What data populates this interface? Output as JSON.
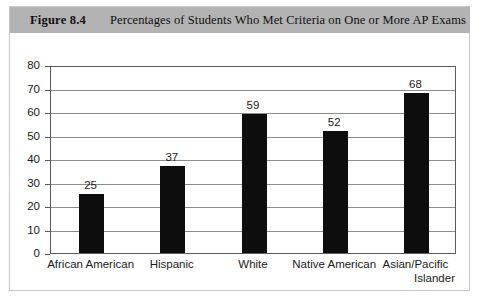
{
  "figure": {
    "number_label": "Figure 8.4",
    "caption": "Percentages of Students Who Met Criteria on One or More AP Exams",
    "band_color": "#b3b3b3"
  },
  "chart_data": {
    "type": "bar",
    "title": "Percentages of Students Who Met Criteria on One or More AP Exams",
    "xlabel": "",
    "ylabel": "",
    "ylim": [
      0,
      80
    ],
    "yticks": [
      0,
      10,
      20,
      30,
      40,
      50,
      60,
      70,
      80
    ],
    "grid": true,
    "legend": false,
    "bar_color": "#0d0d0d",
    "categories": [
      "African American",
      "Hispanic",
      "White",
      "Native American",
      "Asian/Pacific Islander"
    ],
    "category_lines": [
      [
        "African American"
      ],
      [
        "Hispanic"
      ],
      [
        "White"
      ],
      [
        "Native American"
      ],
      [
        "Asian/Pacific",
        "Islander"
      ]
    ],
    "values": [
      25,
      37,
      59,
      52,
      68
    ],
    "value_labels": [
      "25",
      "37",
      "59",
      "52",
      "68"
    ],
    "ytick_labels": [
      "0",
      "10",
      "20",
      "30",
      "40",
      "50",
      "60",
      "70",
      "80"
    ]
  }
}
